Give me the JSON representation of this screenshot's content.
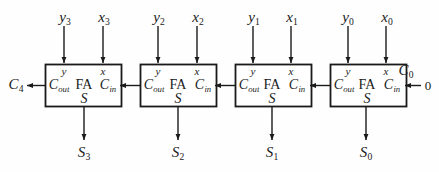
{
  "diagram": {
    "type": "logic-block-diagram",
    "colors": {
      "background": "#fefefe",
      "line": "#1a1a1a",
      "text": "#1a1a1a",
      "box_fill": "#ffffff"
    },
    "stage_count": 4,
    "block_label": "FA",
    "pin_labels": {
      "x": "x",
      "y": "y",
      "carry_out": "C",
      "carry_out_sub": "out",
      "carry_in": "C",
      "carry_in_sub": "in",
      "sum": "S"
    },
    "stages": [
      {
        "index": 3,
        "block": "FA",
        "input_y": "y",
        "input_y_sub": "3",
        "input_x": "x",
        "input_x_sub": "3",
        "sum_out": "S",
        "sum_out_sub": "3",
        "pin_y": "y",
        "pin_x": "x",
        "pin_cout": "C",
        "pin_cout_sub": "out",
        "pin_cin": "C",
        "pin_cin_sub": "in",
        "pin_s": "S"
      },
      {
        "index": 2,
        "block": "FA",
        "input_y": "y",
        "input_y_sub": "2",
        "input_x": "x",
        "input_x_sub": "2",
        "sum_out": "S",
        "sum_out_sub": "2",
        "pin_y": "y",
        "pin_x": "x",
        "pin_cout": "C",
        "pin_cout_sub": "out",
        "pin_cin": "C",
        "pin_cin_sub": "in",
        "pin_s": "S"
      },
      {
        "index": 1,
        "block": "FA",
        "input_y": "y",
        "input_y_sub": "1",
        "input_x": "x",
        "input_x_sub": "1",
        "sum_out": "S",
        "sum_out_sub": "1",
        "pin_y": "y",
        "pin_x": "x",
        "pin_cout": "C",
        "pin_cout_sub": "out",
        "pin_cin": "C",
        "pin_cin_sub": "in",
        "pin_s": "S"
      },
      {
        "index": 0,
        "block": "FA",
        "input_y": "y",
        "input_y_sub": "0",
        "input_x": "x",
        "input_x_sub": "0",
        "sum_out": "S",
        "sum_out_sub": "0",
        "pin_y": "y",
        "pin_x": "x",
        "pin_cout": "C",
        "pin_cout_sub": "out",
        "pin_cin": "C",
        "pin_cin_sub": "in",
        "pin_s": "S"
      }
    ],
    "carry_out_final": {
      "symbol": "C",
      "subscript": "4"
    },
    "carry_in_initial": {
      "symbol": "C",
      "subscript": "0",
      "value": "0"
    }
  }
}
